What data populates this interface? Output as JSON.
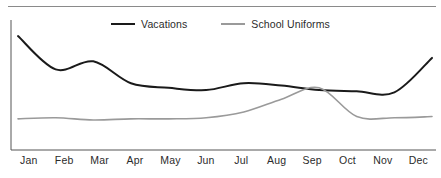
{
  "chart_data": {
    "type": "line",
    "title": "",
    "subtitle": "",
    "xlabel": "",
    "ylabel": "",
    "grid": false,
    "legend_position": "top-center",
    "categories": [
      "Jan",
      "Feb",
      "Mar",
      "Apr",
      "May",
      "Jun",
      "Jul",
      "Aug",
      "Sep",
      "Oct",
      "Nov",
      "Dec"
    ],
    "xlim": [
      0,
      11
    ],
    "ylim": [
      0,
      100
    ],
    "series": [
      {
        "name": "Vacations",
        "color": "#1a1a1a",
        "values": [
          93,
          64,
          71,
          52,
          48,
          46,
          52,
          50,
          46,
          45,
          44,
          74
        ]
      },
      {
        "name": "School Uniforms",
        "color": "#9a9a9a",
        "values": [
          21,
          22,
          20,
          21,
          21,
          22,
          27,
          38,
          48,
          23,
          22,
          23
        ]
      }
    ],
    "annotations": []
  },
  "legend": {
    "entries": [
      {
        "label": "Vacations"
      },
      {
        "label": "School Uniforms"
      }
    ]
  },
  "axis": {
    "x_ticks": [
      "Jan",
      "Feb",
      "Mar",
      "Apr",
      "May",
      "Jun",
      "Jul",
      "Aug",
      "Sep",
      "Oct",
      "Nov",
      "Dec"
    ]
  },
  "colors": {
    "series_vacations": "#1a1a1a",
    "series_school_uniforms": "#9a9a9a",
    "axis": "#555555",
    "divider": "#8a8a8a",
    "text": "#2b2b2b",
    "background": "#ffffff"
  }
}
